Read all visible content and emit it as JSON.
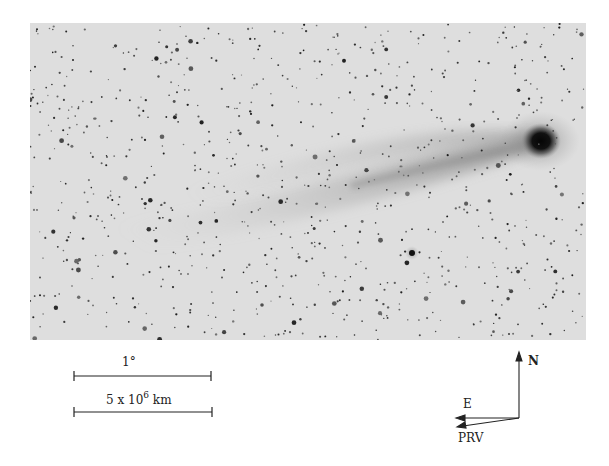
{
  "figure": {
    "colors": {
      "sky": "#dedede",
      "nucleus": "#0a0a0a",
      "tail": "#9a9a9a",
      "stars": "#333333"
    }
  },
  "scale_bars": [
    {
      "label": "1°"
    },
    {
      "label_main": "5 x 10",
      "label_exp": "6",
      "label_unit": " km"
    }
  ],
  "compass": {
    "north": "N",
    "east": "E",
    "prv": "PRV"
  }
}
